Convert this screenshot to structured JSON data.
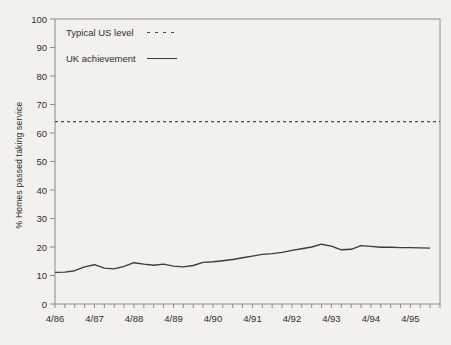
{
  "figure": {
    "ylabel": "% Homes passed taking service",
    "legend": {
      "us": {
        "label": "Typical US level",
        "style": "dashed"
      },
      "uk": {
        "label": "UK achievement",
        "style": "solid"
      }
    }
  },
  "colors": {
    "background": "#f2f1ed",
    "axis": "#8c8c8c",
    "text": "#2e2e2e",
    "dashed_line": "#4a4a4a",
    "solid_line": "#3c3c3c"
  },
  "chart_data": {
    "type": "line",
    "title": "",
    "xlabel": "",
    "ylabel": "% Homes passed taking service",
    "ylim": [
      0,
      100
    ],
    "yticks": [
      0,
      10,
      20,
      30,
      40,
      50,
      60,
      70,
      80,
      90,
      100
    ],
    "grid": false,
    "legend_position": "top-left-inside",
    "x_unit": "quarter",
    "xtick_labels": [
      "4/86",
      "4/87",
      "4/88",
      "4/89",
      "4/90",
      "4/91",
      "4/92",
      "4/93",
      "4/94",
      "4/95"
    ],
    "xtick_every_quarters": 4,
    "x_total_quarter_intervals": 39,
    "series": [
      {
        "name": "Typical US level",
        "type": "constant",
        "style": "dashed",
        "value": 64
      },
      {
        "name": "UK achievement",
        "type": "quarterly",
        "style": "solid",
        "quarters": [
          "4/86",
          "7/86",
          "10/86",
          "1/87",
          "4/87",
          "7/87",
          "10/87",
          "1/88",
          "4/88",
          "7/88",
          "10/88",
          "1/89",
          "4/89",
          "7/89",
          "10/89",
          "1/90",
          "4/90",
          "7/90",
          "10/90",
          "1/91",
          "4/91",
          "7/91",
          "10/91",
          "1/92",
          "4/92",
          "7/92",
          "10/92",
          "1/93",
          "4/93",
          "7/93",
          "10/93",
          "1/94",
          "4/94",
          "7/94",
          "10/94",
          "1/95",
          "4/95",
          "7/95",
          "10/95"
        ],
        "values": [
          11.1,
          11.2,
          11.7,
          13.0,
          13.8,
          12.6,
          12.3,
          13.2,
          14.5,
          14.0,
          13.6,
          14.0,
          13.3,
          13.0,
          13.5,
          14.6,
          14.8,
          15.2,
          15.6,
          16.2,
          16.8,
          17.4,
          17.7,
          18.1,
          18.8,
          19.4,
          20.0,
          21.0,
          20.3,
          19.0,
          19.2,
          20.5,
          20.2,
          19.9,
          19.9,
          19.8,
          19.8,
          19.7,
          19.6
        ]
      }
    ]
  }
}
